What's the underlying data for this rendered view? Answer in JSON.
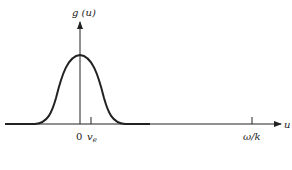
{
  "diagram": {
    "y_axis_label": "g (u)",
    "x_axis_label": "u",
    "ticks": [
      {
        "label": "0",
        "position": "origin"
      },
      {
        "label": "v",
        "subscript": "e",
        "position": "near origin, right"
      },
      {
        "label": "ω/k",
        "position": "far right"
      }
    ],
    "curve": "bell-shaped distribution g(u) centered near 0",
    "colors": {
      "stroke": "#222222",
      "background": "#ffffff"
    }
  }
}
